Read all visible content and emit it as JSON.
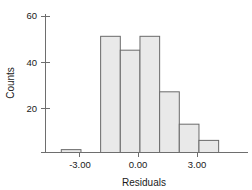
{
  "chart_data": {
    "type": "bar",
    "title": "",
    "subtitle": "",
    "xlabel": "Residuals",
    "ylabel": "Counts",
    "grid": false,
    "legend": false,
    "legend_position": "none",
    "xlim": [
      -4.0,
      4.0
    ],
    "ylim": [
      0,
      62
    ],
    "xticks": [
      -3.0,
      0.0,
      3.0
    ],
    "xtick_labels": [
      "-3.00",
      "0.00",
      "3.00"
    ],
    "yticks": [
      20,
      40,
      60
    ],
    "ytick_labels": [
      "20",
      "40",
      "60"
    ],
    "bin_width": 1.0,
    "bin_edges": [
      -3.9,
      -2.9,
      -1.9,
      -0.9,
      0.1,
      1.1,
      2.1,
      3.1,
      4.1
    ],
    "bin_centers": [
      -3.4,
      -2.4,
      -1.4,
      -0.4,
      0.6,
      1.6,
      2.6,
      3.6
    ],
    "categories": [
      "-3.4",
      "-2.4",
      "-1.4",
      "-0.4",
      "0.6",
      "1.6",
      "2.6",
      "3.6"
    ],
    "values": [
      2,
      0,
      51,
      45,
      51,
      27,
      13,
      6
    ],
    "bar_fill": "#e9e9e9",
    "bar_stroke": "#6a6a6a",
    "axis_color": "#6e6e6e",
    "text_color": "#1a1a1a",
    "background": "#ffffff"
  },
  "axes": {
    "y_title": "Counts",
    "x_title": "Residuals",
    "y_tick_0": "20",
    "y_tick_1": "40",
    "y_tick_2": "60",
    "x_tick_0": "-3.00",
    "x_tick_1": "0.00",
    "x_tick_2": "3.00"
  }
}
